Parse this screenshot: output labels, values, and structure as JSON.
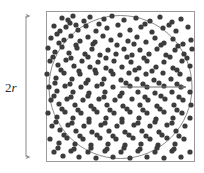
{
  "figure": {
    "labels": {
      "diameter_prefix": "2",
      "diameter_var": "r"
    },
    "colors": {
      "dot": "#3c3c3c",
      "square_stroke": "#9a9a9a",
      "circle_stroke": "#8c8c8c",
      "arrow_stroke": "#6e6e6e",
      "dimension_stroke": "#8a8a8a",
      "background": "#ffffff",
      "text": "#2b2b2b"
    },
    "square": {
      "x": 46,
      "y": 11,
      "width": 149,
      "height": 151,
      "stroke_width": 1
    },
    "circle": {
      "cx": 120.5,
      "cy": 87,
      "r": 71.5,
      "stroke_width": 1
    },
    "radius_arrow": {
      "x1": 120.5,
      "y1": 87,
      "x2": 189,
      "y2": 87,
      "stroke_width": 1,
      "head_size": 4
    },
    "dimension_arrow": {
      "x": 26,
      "y1": 12,
      "y2": 161,
      "stroke_width": 1,
      "head_size": 3.5,
      "label_x": 5,
      "label_y": 80
    },
    "dot_radius": 2.6,
    "dots": [
      [
        62,
        18
      ],
      [
        68,
        20
      ],
      [
        73,
        16
      ],
      [
        84,
        21
      ],
      [
        90,
        17
      ],
      [
        104,
        19
      ],
      [
        112,
        16
      ],
      [
        124,
        20
      ],
      [
        136,
        18
      ],
      [
        150,
        21
      ],
      [
        160,
        17
      ],
      [
        172,
        22
      ],
      [
        181,
        19
      ],
      [
        54,
        26
      ],
      [
        60,
        31
      ],
      [
        66,
        27
      ],
      [
        78,
        30
      ],
      [
        86,
        26
      ],
      [
        96,
        31
      ],
      [
        107,
        28
      ],
      [
        118,
        25
      ],
      [
        130,
        30
      ],
      [
        141,
        27
      ],
      [
        152,
        32
      ],
      [
        163,
        28
      ],
      [
        176,
        31
      ],
      [
        188,
        27
      ],
      [
        51,
        38
      ],
      [
        57,
        34
      ],
      [
        64,
        40
      ],
      [
        71,
        36
      ],
      [
        80,
        41
      ],
      [
        88,
        37
      ],
      [
        95,
        42
      ],
      [
        103,
        36
      ],
      [
        111,
        40
      ],
      [
        120,
        35
      ],
      [
        128,
        41
      ],
      [
        137,
        37
      ],
      [
        146,
        42
      ],
      [
        155,
        38
      ],
      [
        164,
        43
      ],
      [
        173,
        39
      ],
      [
        183,
        44
      ],
      [
        191,
        40
      ],
      [
        48,
        48
      ],
      [
        55,
        52
      ],
      [
        62,
        47
      ],
      [
        69,
        53
      ],
      [
        77,
        48
      ],
      [
        85,
        54
      ],
      [
        92,
        49
      ],
      [
        100,
        55
      ],
      [
        108,
        50
      ],
      [
        116,
        54
      ],
      [
        124,
        49
      ],
      [
        132,
        55
      ],
      [
        140,
        50
      ],
      [
        149,
        54
      ],
      [
        157,
        49
      ],
      [
        166,
        55
      ],
      [
        175,
        50
      ],
      [
        184,
        54
      ],
      [
        192,
        49
      ],
      [
        50,
        61
      ],
      [
        58,
        65
      ],
      [
        66,
        60
      ],
      [
        74,
        66
      ],
      [
        82,
        61
      ],
      [
        90,
        67
      ],
      [
        98,
        62
      ],
      [
        106,
        68
      ],
      [
        114,
        61
      ],
      [
        122,
        67
      ],
      [
        131,
        62
      ],
      [
        139,
        68
      ],
      [
        147,
        61
      ],
      [
        156,
        67
      ],
      [
        164,
        62
      ],
      [
        173,
        68
      ],
      [
        182,
        61
      ],
      [
        190,
        66
      ],
      [
        47,
        74
      ],
      [
        56,
        78
      ],
      [
        64,
        73
      ],
      [
        72,
        79
      ],
      [
        80,
        74
      ],
      [
        88,
        80
      ],
      [
        96,
        73
      ],
      [
        104,
        79
      ],
      [
        113,
        74
      ],
      [
        121,
        80
      ],
      [
        129,
        73
      ],
      [
        137,
        79
      ],
      [
        146,
        74
      ],
      [
        154,
        80
      ],
      [
        163,
        73
      ],
      [
        171,
        79
      ],
      [
        180,
        74
      ],
      [
        189,
        79
      ],
      [
        49,
        87
      ],
      [
        57,
        91
      ],
      [
        65,
        86
      ],
      [
        73,
        92
      ],
      [
        81,
        87
      ],
      [
        89,
        93
      ],
      [
        97,
        86
      ],
      [
        105,
        92
      ],
      [
        113,
        87
      ],
      [
        122,
        93
      ],
      [
        130,
        86
      ],
      [
        138,
        92
      ],
      [
        147,
        87
      ],
      [
        155,
        93
      ],
      [
        164,
        86
      ],
      [
        172,
        92
      ],
      [
        181,
        87
      ],
      [
        190,
        92
      ],
      [
        51,
        100
      ],
      [
        59,
        104
      ],
      [
        67,
        99
      ],
      [
        75,
        105
      ],
      [
        83,
        100
      ],
      [
        91,
        106
      ],
      [
        99,
        99
      ],
      [
        107,
        105
      ],
      [
        115,
        100
      ],
      [
        123,
        106
      ],
      [
        132,
        99
      ],
      [
        140,
        105
      ],
      [
        148,
        100
      ],
      [
        157,
        106
      ],
      [
        165,
        99
      ],
      [
        174,
        105
      ],
      [
        183,
        100
      ],
      [
        191,
        105
      ],
      [
        48,
        113
      ],
      [
        57,
        117
      ],
      [
        65,
        112
      ],
      [
        73,
        118
      ],
      [
        81,
        113
      ],
      [
        89,
        119
      ],
      [
        97,
        112
      ],
      [
        106,
        118
      ],
      [
        114,
        113
      ],
      [
        122,
        119
      ],
      [
        130,
        112
      ],
      [
        139,
        118
      ],
      [
        147,
        113
      ],
      [
        156,
        119
      ],
      [
        164,
        112
      ],
      [
        173,
        118
      ],
      [
        182,
        113
      ],
      [
        190,
        118
      ],
      [
        52,
        126
      ],
      [
        60,
        130
      ],
      [
        68,
        125
      ],
      [
        76,
        131
      ],
      [
        84,
        126
      ],
      [
        92,
        132
      ],
      [
        101,
        125
      ],
      [
        109,
        131
      ],
      [
        117,
        126
      ],
      [
        125,
        132
      ],
      [
        134,
        125
      ],
      [
        142,
        131
      ],
      [
        150,
        126
      ],
      [
        159,
        132
      ],
      [
        167,
        125
      ],
      [
        176,
        131
      ],
      [
        185,
        126
      ],
      [
        50,
        139
      ],
      [
        59,
        143
      ],
      [
        67,
        138
      ],
      [
        75,
        144
      ],
      [
        83,
        139
      ],
      [
        91,
        145
      ],
      [
        100,
        138
      ],
      [
        108,
        144
      ],
      [
        116,
        139
      ],
      [
        125,
        145
      ],
      [
        133,
        138
      ],
      [
        141,
        144
      ],
      [
        150,
        139
      ],
      [
        158,
        145
      ],
      [
        167,
        138
      ],
      [
        175,
        144
      ],
      [
        184,
        139
      ],
      [
        54,
        152
      ],
      [
        63,
        156
      ],
      [
        71,
        151
      ],
      [
        79,
        157
      ],
      [
        88,
        152
      ],
      [
        96,
        158
      ],
      [
        105,
        151
      ],
      [
        113,
        157
      ],
      [
        121,
        152
      ],
      [
        130,
        158
      ],
      [
        138,
        151
      ],
      [
        147,
        157
      ],
      [
        155,
        152
      ],
      [
        164,
        158
      ],
      [
        172,
        151
      ],
      [
        181,
        157
      ],
      [
        190,
        152
      ],
      [
        70,
        23
      ],
      [
        76,
        25
      ],
      [
        99,
        24
      ],
      [
        145,
        24
      ],
      [
        169,
        25
      ],
      [
        59,
        43
      ],
      [
        76,
        45
      ],
      [
        93,
        44
      ],
      [
        117,
        45
      ],
      [
        134,
        44
      ],
      [
        161,
        45
      ],
      [
        178,
        46
      ],
      [
        53,
        57
      ],
      [
        71,
        58
      ],
      [
        88,
        57
      ],
      [
        106,
        58
      ],
      [
        127,
        57
      ],
      [
        144,
        58
      ],
      [
        170,
        57
      ],
      [
        187,
        58
      ],
      [
        61,
        70
      ],
      [
        79,
        71
      ],
      [
        95,
        70
      ],
      [
        111,
        71
      ],
      [
        135,
        70
      ],
      [
        152,
        71
      ],
      [
        177,
        70
      ],
      [
        55,
        83
      ],
      [
        70,
        84
      ],
      [
        86,
        83
      ],
      [
        102,
        84
      ],
      [
        126,
        83
      ],
      [
        143,
        84
      ],
      [
        159,
        83
      ],
      [
        177,
        84
      ],
      [
        54,
        96
      ],
      [
        71,
        97
      ],
      [
        88,
        96
      ],
      [
        104,
        97
      ],
      [
        120,
        96
      ],
      [
        145,
        97
      ],
      [
        161,
        96
      ],
      [
        179,
        97
      ],
      [
        62,
        109
      ],
      [
        78,
        110
      ],
      [
        94,
        109
      ],
      [
        110,
        110
      ],
      [
        127,
        109
      ],
      [
        143,
        110
      ],
      [
        160,
        109
      ],
      [
        177,
        110
      ],
      [
        56,
        122
      ],
      [
        72,
        123
      ],
      [
        89,
        122
      ],
      [
        105,
        123
      ],
      [
        122,
        122
      ],
      [
        138,
        123
      ],
      [
        155,
        122
      ],
      [
        172,
        123
      ],
      [
        64,
        135
      ],
      [
        80,
        136
      ],
      [
        97,
        135
      ],
      [
        113,
        136
      ],
      [
        129,
        135
      ],
      [
        146,
        136
      ],
      [
        162,
        135
      ],
      [
        179,
        136
      ],
      [
        58,
        148
      ],
      [
        74,
        149
      ],
      [
        91,
        148
      ],
      [
        107,
        149
      ],
      [
        124,
        148
      ],
      [
        140,
        149
      ],
      [
        157,
        148
      ],
      [
        174,
        149
      ]
    ]
  }
}
